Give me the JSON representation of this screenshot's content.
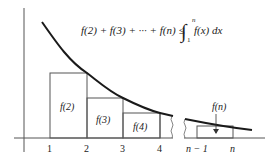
{
  "diagram": {
    "formula": {
      "lhs": "f(2) + f(3) + ··· + f(n) ≤",
      "integral_symbol": "∫",
      "upper_limit": "n",
      "lower_limit": "1",
      "integrand": "f(x) dx"
    },
    "rect_labels": [
      "f(2)",
      "f(3)",
      "f(4)"
    ],
    "right_label": "f(n)",
    "x_ticks": [
      "1",
      "2",
      "3",
      "4"
    ],
    "right_ticks": [
      "n − 1",
      "n"
    ],
    "colors": {
      "curve": "#1a1a1a",
      "lines": "#444444",
      "text": "#222222"
    }
  }
}
